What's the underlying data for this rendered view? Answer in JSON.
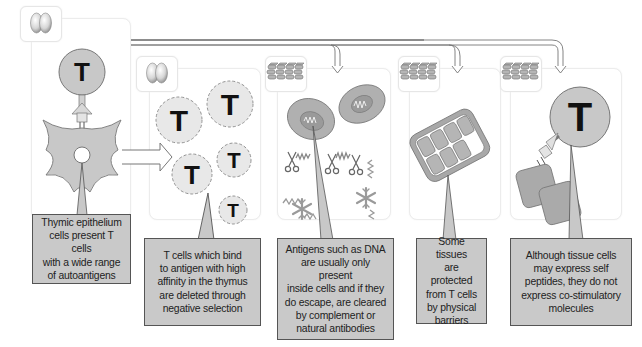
{
  "figure": {
    "colors": {
      "cell_fill": "#c8c8c8",
      "cell_stroke": "#777777",
      "callout_fill": "#c9c9c9",
      "callout_border": "#555555",
      "panel_border": "#ececec",
      "arrow_stroke": "#777777"
    },
    "icons": {
      "thymus": "thymus-icon",
      "tissue": "tissue-icon"
    },
    "panels": [
      {
        "id": "thymic-presentation",
        "icon": "thymus-icon",
        "cell_labels": [
          "T"
        ],
        "callout": "Thymic epithelium\ncells present T cells\nwith a wide range\nof autoantigens"
      },
      {
        "id": "negative-selection",
        "icon": "thymus-icon",
        "cell_labels": [
          "T",
          "T",
          "T",
          "T",
          "T"
        ],
        "callout": "T cells which bind\nto antigen with high\naffinity in the thymus\nare deleted through\nnegative selection"
      },
      {
        "id": "sequestered-antigen",
        "icon": "tissue-icon",
        "cell_labels": [],
        "callout": "Antigens such as DNA\nare usually only present\ninside cells and if they\ndo escape, are cleared\nby complement or\nnatural antibodies"
      },
      {
        "id": "physical-barriers",
        "icon": "tissue-icon",
        "cell_labels": [],
        "callout": "Some tissues\nare protected\nfrom T cells\nby physical\nbarriers"
      },
      {
        "id": "no-costimulation",
        "icon": "tissue-icon",
        "cell_labels": [
          "T"
        ],
        "callout": "Although tissue cells\nmay express self\npeptides, they do not\nexpress co-stimulatory\nmolecules"
      }
    ]
  }
}
